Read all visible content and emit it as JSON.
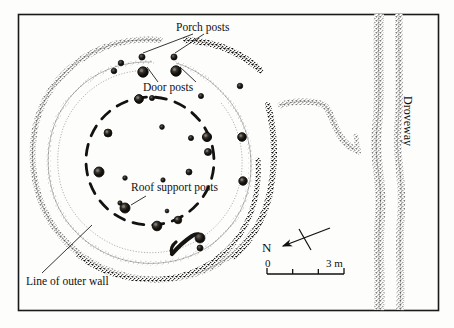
{
  "figure": {
    "type": "archaeological-site-plan",
    "background_color": "#fdfdfc",
    "ink_color": "#12100e"
  },
  "frame": {
    "name": "plan-border",
    "x": 18,
    "y": 14,
    "width": 420,
    "height": 296,
    "stroke_color": "#1a1a1a"
  },
  "labels": {
    "porch_posts": "Porch posts",
    "door_posts": "Door posts",
    "roof_support_posts": "Roof support posts",
    "line_of_outer_wall": "Line of outer wall",
    "droveway": "Droveway",
    "north": "N"
  },
  "scale_bar": {
    "start_label": "0",
    "end_label": "3 m",
    "x_start": 267,
    "x_end": 344,
    "y": 274,
    "segments": 3,
    "tick_height": 6
  },
  "north_arrow": {
    "label": "N",
    "tail_x": 330,
    "tail_y": 228,
    "head_x": 280,
    "head_y": 247,
    "crossbar_length": 20
  },
  "features": {
    "outer_wall": {
      "name": "outer-wall-ring",
      "description": "outermost stippled circular wall line of roundhouse",
      "cx": 150,
      "cy": 155,
      "rx": 118,
      "ry": 116
    },
    "inner_wall": {
      "name": "inner-wall-ring",
      "description": "inner stippled wall line of roundhouse",
      "cx": 150,
      "cy": 157,
      "rx": 96,
      "ry": 94
    },
    "roof_post_ring": {
      "name": "roof-support-post-ring",
      "description": "dashed circle marking ring of roof support post holes",
      "cx": 150,
      "cy": 160,
      "rx": 66,
      "ry": 66
    },
    "entrance_gap": {
      "name": "entrance-gap",
      "description": "break in the wall circuit at the north-east for the porch / doorway"
    },
    "droveway": {
      "name": "droveway-ditches",
      "description": "two parallel stippled ditch lines running north-south at right of plan"
    },
    "field_boundary": {
      "name": "field-boundary-ditch",
      "description": "stippled linear ditch running from roundhouse area east to the droveway"
    }
  },
  "post_holes": {
    "porch": [
      {
        "cx": 142,
        "cy": 57,
        "r": 3.1
      },
      {
        "cx": 174,
        "cy": 57,
        "r": 3.1
      }
    ],
    "door": [
      {
        "cx": 143,
        "cy": 72,
        "r": 5.2
      },
      {
        "cx": 176,
        "cy": 71,
        "r": 5.2
      }
    ],
    "roof_support": [
      {
        "cx": 139,
        "cy": 99,
        "r": 4.4
      },
      {
        "cx": 108,
        "cy": 133,
        "r": 4.0
      },
      {
        "cx": 99,
        "cy": 172,
        "r": 5.0
      },
      {
        "cx": 125,
        "cy": 208,
        "r": 5.0
      },
      {
        "cx": 157,
        "cy": 226,
        "r": 4.8
      },
      {
        "cx": 207,
        "cy": 137,
        "r": 4.6
      },
      {
        "cx": 242,
        "cy": 137,
        "r": 4.3
      },
      {
        "cx": 243,
        "cy": 181,
        "r": 4.2
      },
      {
        "cx": 208,
        "cy": 152,
        "r": 3.6
      },
      {
        "cx": 178,
        "cy": 220,
        "r": 3.8
      }
    ],
    "interior_minor": [
      {
        "cx": 162,
        "cy": 127,
        "r": 2.4
      },
      {
        "cx": 191,
        "cy": 138,
        "r": 2.6
      },
      {
        "cx": 189,
        "cy": 172,
        "r": 3.0
      },
      {
        "cx": 163,
        "cy": 180,
        "r": 2.2
      },
      {
        "cx": 125,
        "cy": 178,
        "r": 2.3
      },
      {
        "cx": 120,
        "cy": 203,
        "r": 2.2
      },
      {
        "cx": 167,
        "cy": 211,
        "r": 1.9
      },
      {
        "cx": 152,
        "cy": 98,
        "r": 2.6
      },
      {
        "cx": 201,
        "cy": 96,
        "r": 2.6
      }
    ],
    "wall_line": [
      {
        "cx": 121,
        "cy": 63,
        "r": 2.8
      },
      {
        "cx": 114,
        "cy": 71,
        "r": 2.8
      },
      {
        "cx": 240,
        "cy": 86,
        "r": 2.8
      },
      {
        "cx": 200,
        "cy": 248,
        "r": 3.0
      }
    ]
  },
  "leaders": [
    {
      "name": "porch-leader-left",
      "x1": 193,
      "y1": 34,
      "x2": 143,
      "y2": 53
    },
    {
      "name": "porch-leader-right",
      "x1": 204,
      "y1": 34,
      "x2": 175,
      "y2": 53
    },
    {
      "name": "door-leader-left",
      "x1": 158,
      "y1": 82,
      "x2": 147,
      "y2": 67
    },
    {
      "name": "door-leader-right",
      "x1": 196,
      "y1": 82,
      "x2": 180,
      "y2": 67
    },
    {
      "name": "roof-leader",
      "x1": 146,
      "y1": 196,
      "x2": 131,
      "y2": 205
    },
    {
      "name": "outer-wall-leader",
      "x1": 42,
      "y1": 273,
      "x2": 92,
      "y2": 225
    }
  ]
}
